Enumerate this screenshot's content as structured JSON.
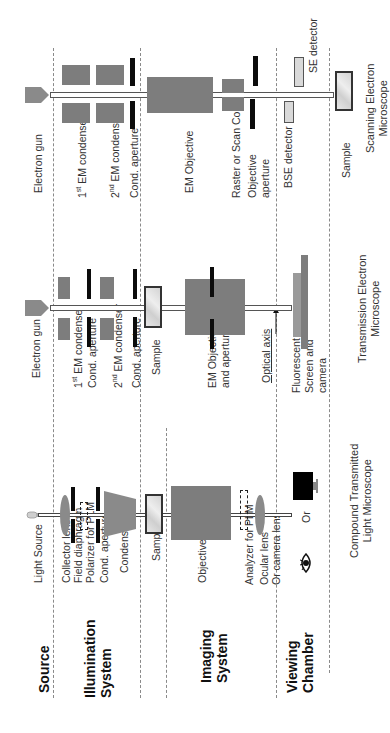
{
  "categories": {
    "source": "Source",
    "illumination_1": "Illumination",
    "illumination_2": "System",
    "imaging_1": "Imaging",
    "imaging_2": "System",
    "viewing_1": "Viewing",
    "viewing_2": "Chamber"
  },
  "light_microscope": {
    "light_source": "Light Source",
    "collector_lens": "Collector lens",
    "field_diaphragm": "Field diaphragm",
    "polarizer": "Polarizer for PLM",
    "cond_aperture": "Cond.  aperture",
    "condenser": "Condenser",
    "sample": "Sample",
    "objective": "Objective (lens)",
    "analyzer": "Analyzer for PLM",
    "ocular_lens": "Ocular lens",
    "camera_lens": "Or camera lens",
    "or_label": "Or",
    "title_1": "Compound Transmitted",
    "title_2": "Light Microscope"
  },
  "tem": {
    "electron_gun": "Electron gun",
    "condenser_1_prefix": "1",
    "condenser_1_sup": "st",
    "condenser_1_suffix": " EM condenser",
    "cond_aperture_1": "Cond. aperture",
    "condenser_2_prefix": "2",
    "condenser_2_sup": "nd",
    "condenser_2_suffix": " EM condenser",
    "cond_aperture_2": "Cond. aperture",
    "sample": "Sample",
    "objective_1": "EM Objective",
    "objective_2": "and aperture",
    "optical_axis": "Optical axis",
    "screen_1": "Fluorescent",
    "screen_2": "Screen and",
    "screen_3": "camera",
    "title_1": "Transmission Electron",
    "title_2": "Microscope"
  },
  "sem": {
    "electron_gun": "Electron gun",
    "condenser_1_prefix": "1",
    "condenser_1_sup": "st",
    "condenser_1_suffix": " EM condenser",
    "condenser_2_prefix": "2",
    "condenser_2_sup": "nd",
    "condenser_2_suffix": " EM condenser",
    "cond_aperture": "Cond. aperture",
    "objective": "EM Objective",
    "scan_coils": "Raster or Scan Coils",
    "objective_aperture_1": "Objective",
    "objective_aperture_2": "aperture",
    "bse_detector": "BSE detector",
    "se_detector": "SE detector",
    "sample": "Sample",
    "title_1": "Scanning Electron",
    "title_2": "Microscope"
  },
  "colors": {
    "component_gray": "#7d7d7d",
    "aperture_black": "#0c0c0c",
    "detector_fill": "#d9d9d9",
    "divider": "#8a8a8a"
  }
}
